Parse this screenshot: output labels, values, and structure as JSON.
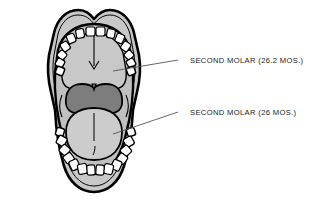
{
  "figure": {
    "background_color": "#ffffff",
    "outline_color": "#000000",
    "face_fill": "#c8c8c8",
    "oral_cavity_fill": "#c0c0c0",
    "tongue_fill": "#cccccc",
    "palate_fill": "#7d7d7d",
    "tooth_fill": "#ffffff",
    "leader_color": "#555555"
  },
  "diagram": {
    "name": "open-mouth-superior-view",
    "arrow": {
      "name": "eruption-direction-arrow",
      "direction": "down"
    },
    "parts": [
      {
        "name": "upper-lip",
        "label": "Upper lip"
      },
      {
        "name": "lower-lip",
        "label": "Lower lip"
      },
      {
        "name": "hard-palate",
        "label": "Hard palate"
      },
      {
        "name": "soft-palate",
        "label": "Soft palate"
      },
      {
        "name": "tongue",
        "label": "Tongue"
      },
      {
        "name": "upper-dental-arch",
        "label": "Upper dental arch"
      },
      {
        "name": "lower-dental-arch",
        "label": "Lower dental arch"
      }
    ],
    "upper_teeth_count": 14,
    "lower_teeth_count": 14
  },
  "callouts": [
    {
      "id": "upper-second-molar",
      "text": "SECOND MOLAR (26.2 MOS.)",
      "tooth": "SECOND MOLAR",
      "age_value": "26.2",
      "age_unit": "MOS.",
      "arch": "upper",
      "text_x": 190,
      "text_y": 63,
      "leader": {
        "x1": 178,
        "y1": 60,
        "x2": 113,
        "y2": 71
      }
    },
    {
      "id": "lower-second-molar",
      "text": "SECOND MOLAR (26 MOS.)",
      "tooth": "SECOND MOLAR",
      "age_value": "26",
      "age_unit": "MOS.",
      "arch": "lower",
      "text_x": 190,
      "text_y": 115,
      "leader": {
        "x1": 178,
        "y1": 112,
        "x2": 113,
        "y2": 134
      }
    }
  ]
}
